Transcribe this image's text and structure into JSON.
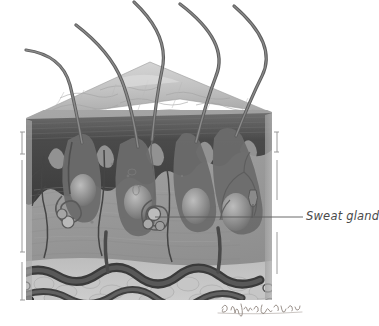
{
  "figure": {
    "type": "anatomical-illustration",
    "palette": {
      "background": "#ffffff",
      "label_text": "#4a4a4a",
      "leader_line": "#5a5a5a",
      "epidermis_dark": "#4b4b4b",
      "dermis_mid": "#9a9a9a",
      "surface_light": "#c9c9c9",
      "hair_shaft": "#5e5e5e",
      "vessel_dark": "#3f3f3f",
      "subcutaneous": "#b5b5b5",
      "tick_mark": "#8e8e8e",
      "signature": "#8a7f78"
    }
  },
  "labels": [
    {
      "id": "sweat-gland",
      "text": "Sweat gland",
      "leader": {
        "x1": 155,
        "y1": 217,
        "x2": 303,
        "y2": 217
      }
    }
  ],
  "signature": {
    "text": "B. Wayne Barrow",
    "description": "artist handwritten signature"
  },
  "structures": [
    {
      "name": "hair-shaft",
      "count": 5
    },
    {
      "name": "epidermis-surface",
      "count": 1
    },
    {
      "name": "epidermis-layer",
      "count": 1
    },
    {
      "name": "dermis-layer",
      "count": 1
    },
    {
      "name": "hair-follicle",
      "count": 4
    },
    {
      "name": "sweat-gland-coil",
      "count": 2
    },
    {
      "name": "blood-vessel",
      "count": 6
    },
    {
      "name": "nerve-branch",
      "count": 2
    },
    {
      "name": "subcutaneous-fat",
      "count": 1
    },
    {
      "name": "edge-tick-mark",
      "count": 6
    }
  ]
}
